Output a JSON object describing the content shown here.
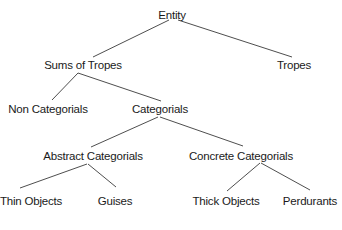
{
  "diagram": {
    "type": "tree",
    "title": "",
    "nodes": {
      "entity": {
        "label": "Entity",
        "x": 172,
        "y": 9
      },
      "sums_of_tropes": {
        "label": "Sums of Tropes",
        "x": 83,
        "y": 59
      },
      "tropes": {
        "label": "Tropes",
        "x": 294,
        "y": 59
      },
      "non_categorials": {
        "label": "Non Categorials",
        "x": 48,
        "y": 103
      },
      "categorials": {
        "label": "Categorials",
        "x": 160,
        "y": 103
      },
      "abstract_categorials": {
        "label": "Abstract Categorials",
        "x": 93,
        "y": 150
      },
      "concrete_categorials": {
        "label": "Concrete Categorials",
        "x": 241,
        "y": 150
      },
      "thin_objects": {
        "label": "Thin Objects",
        "x": 31,
        "y": 195
      },
      "guises": {
        "label": "Guises",
        "x": 115,
        "y": 195
      },
      "thick_objects": {
        "label": "Thick Objects",
        "x": 226,
        "y": 195
      },
      "perdurants": {
        "label": "Perdurants",
        "x": 310,
        "y": 195
      }
    },
    "edges": [
      {
        "from": "entity",
        "to": "sums_of_tropes",
        "x1": 169,
        "y1": 20,
        "x2": 93,
        "y2": 57
      },
      {
        "from": "entity",
        "to": "tropes",
        "x1": 178,
        "y1": 20,
        "x2": 292,
        "y2": 57
      },
      {
        "from": "sums_of_tropes",
        "to": "non_categorials",
        "x1": 78,
        "y1": 73,
        "x2": 52,
        "y2": 100
      },
      {
        "from": "sums_of_tropes",
        "to": "categorials",
        "x1": 78,
        "y1": 73,
        "x2": 161,
        "y2": 101
      },
      {
        "from": "categorials",
        "to": "abstract_categorials",
        "x1": 158,
        "y1": 117,
        "x2": 91,
        "y2": 147
      },
      {
        "from": "categorials",
        "to": "concrete_categorials",
        "x1": 160,
        "y1": 117,
        "x2": 243,
        "y2": 146
      },
      {
        "from": "abstract_categorials",
        "to": "thin_objects",
        "x1": 87,
        "y1": 164,
        "x2": 20,
        "y2": 188
      },
      {
        "from": "abstract_categorials",
        "to": "guises",
        "x1": 88,
        "y1": 164,
        "x2": 116,
        "y2": 187
      },
      {
        "from": "concrete_categorials",
        "to": "thick_objects",
        "x1": 260,
        "y1": 163,
        "x2": 227,
        "y2": 191
      },
      {
        "from": "concrete_categorials",
        "to": "perdurants",
        "x1": 261,
        "y1": 163,
        "x2": 310,
        "y2": 190
      }
    ],
    "colors": {
      "background": "#ffffff",
      "text": "#1a1a1a",
      "edge": "#3a3a3a"
    }
  }
}
